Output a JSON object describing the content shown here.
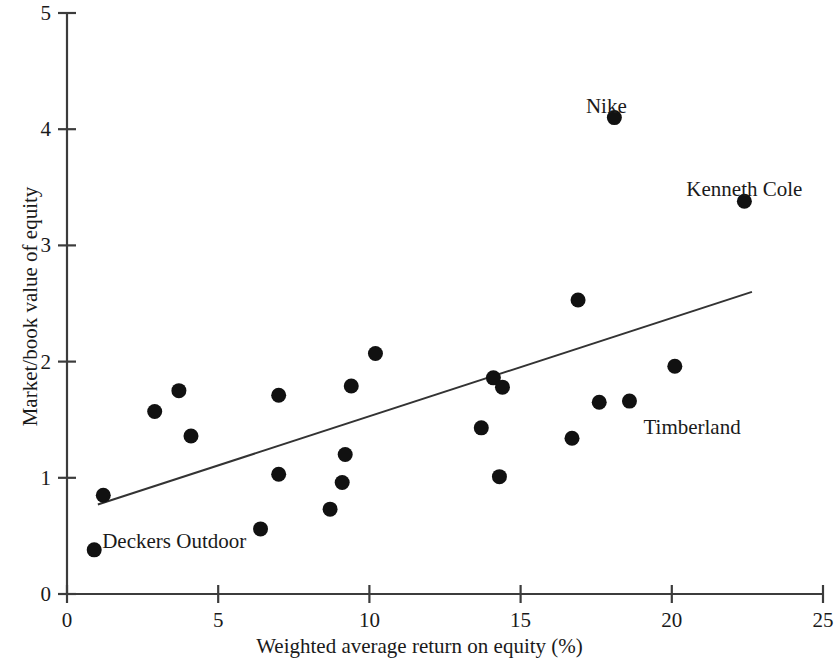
{
  "chart_data": {
    "type": "scatter",
    "title": "",
    "xlabel": "Weighted average return on equity (%)",
    "ylabel": "Market/book value of equity",
    "xlim": [
      0,
      25
    ],
    "ylim": [
      0,
      5
    ],
    "xticks": [
      0,
      5,
      10,
      15,
      20,
      25
    ],
    "yticks": [
      0,
      1,
      2,
      3,
      4,
      5
    ],
    "xtick_labels": [
      "0",
      "5",
      "10",
      "15",
      "20",
      "25"
    ],
    "ytick_labels": [
      "0",
      "1",
      "2",
      "3",
      "4",
      "5"
    ],
    "grid": false,
    "legend": "none",
    "marker": "filled-circle",
    "marker_color": "#111111",
    "axis_color": "#3c3c3c",
    "points": [
      {
        "x": 0.9,
        "y": 0.38,
        "label": "Deckers Outdoor"
      },
      {
        "x": 1.2,
        "y": 0.85,
        "label": ""
      },
      {
        "x": 2.9,
        "y": 1.57,
        "label": ""
      },
      {
        "x": 3.7,
        "y": 1.75,
        "label": ""
      },
      {
        "x": 4.1,
        "y": 1.36,
        "label": ""
      },
      {
        "x": 6.4,
        "y": 0.56,
        "label": ""
      },
      {
        "x": 7.0,
        "y": 1.71,
        "label": ""
      },
      {
        "x": 7.0,
        "y": 1.03,
        "label": ""
      },
      {
        "x": 8.7,
        "y": 0.73,
        "label": ""
      },
      {
        "x": 9.1,
        "y": 0.96,
        "label": ""
      },
      {
        "x": 9.2,
        "y": 1.2,
        "label": ""
      },
      {
        "x": 9.4,
        "y": 1.79,
        "label": ""
      },
      {
        "x": 10.2,
        "y": 2.07,
        "label": ""
      },
      {
        "x": 13.7,
        "y": 1.43,
        "label": ""
      },
      {
        "x": 14.1,
        "y": 1.86,
        "label": ""
      },
      {
        "x": 14.4,
        "y": 1.78,
        "label": ""
      },
      {
        "x": 14.3,
        "y": 1.01,
        "label": ""
      },
      {
        "x": 16.7,
        "y": 1.34,
        "label": ""
      },
      {
        "x": 16.9,
        "y": 2.53,
        "label": ""
      },
      {
        "x": 17.6,
        "y": 1.65,
        "label": ""
      },
      {
        "x": 18.1,
        "y": 4.1,
        "label": "Nike"
      },
      {
        "x": 18.6,
        "y": 1.66,
        "label": "Timberland"
      },
      {
        "x": 20.1,
        "y": 1.96,
        "label": ""
      },
      {
        "x": 22.4,
        "y": 3.38,
        "label": "Kenneth Cole"
      }
    ],
    "annotations": [
      {
        "text": "Nike",
        "x": 18.1,
        "y": 4.1,
        "dx": -8,
        "dy": -0.31,
        "anchor": "middle"
      },
      {
        "text": "Kenneth Cole",
        "x": 22.4,
        "y": 3.38,
        "dx": 0,
        "dy": -0.31,
        "anchor": "middle"
      },
      {
        "text": "Timberland",
        "x": 18.6,
        "y": 1.66,
        "dx": 14,
        "dy": 0.02,
        "anchor": "start"
      },
      {
        "text": "Deckers Outdoor",
        "x": 0.9,
        "y": 0.38,
        "dx": 8,
        "dy": -0.28,
        "anchor": "start"
      }
    ],
    "trendline": {
      "type": "linear-fit",
      "x0": 1.02,
      "y0": 0.77,
      "x1": 22.65,
      "y1": 2.6,
      "color": "#333333"
    }
  }
}
